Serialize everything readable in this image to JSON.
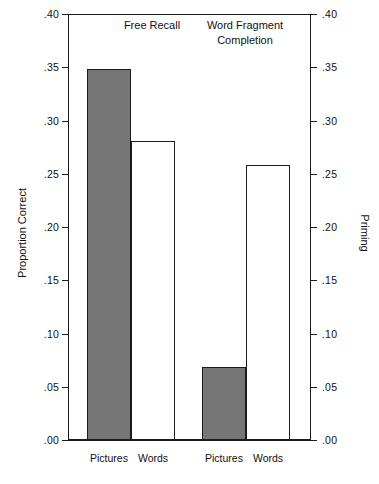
{
  "chart_data": {
    "type": "bar",
    "title": "",
    "subtitle": "",
    "xlabel": "",
    "ylabel": "Proportion Correct",
    "ylabel_right": "Priming",
    "ylim": [
      0.0,
      0.4
    ],
    "ylim_right": [
      0.0,
      0.4
    ],
    "grid": false,
    "legend": "none",
    "ytick_labels": [
      ".40",
      ".35",
      ".30",
      ".25",
      ".20",
      ".15",
      ".10",
      ".05",
      ".00"
    ],
    "ytick_values": [
      0.4,
      0.35,
      0.3,
      0.25,
      0.2,
      0.15,
      0.1,
      0.05,
      0.0
    ],
    "ytick_labels_right": [
      ".40",
      ".35",
      ".30",
      ".25",
      ".20",
      ".15",
      ".10",
      ".05",
      ".00"
    ],
    "groups": [
      {
        "name": "Free Recall",
        "axis": "left",
        "categories": [
          "Pictures",
          "Words"
        ],
        "values": [
          0.348,
          0.281
        ],
        "styles": [
          "filled",
          "open"
        ]
      },
      {
        "name": "Word Fragment\nCompletion",
        "axis": "right",
        "categories": [
          "Pictures",
          "Words"
        ],
        "values": [
          0.069,
          0.258
        ],
        "styles": [
          "filled",
          "open"
        ]
      }
    ],
    "categories": [
      "Pictures",
      "Words",
      "Pictures",
      "Words"
    ],
    "values": [
      0.348,
      0.281,
      0.069,
      0.258
    ],
    "series": [
      {
        "name": "Proportion Correct / Priming",
        "values": [
          0.348,
          0.281,
          0.069,
          0.258
        ]
      }
    ],
    "colors": {
      "filled_bar": "#767676",
      "open_bar": "#ffffff",
      "outline": "#1b1b1b",
      "background": "#ffffff",
      "text": "#111111"
    }
  },
  "bars": [
    {
      "label": "Pictures",
      "group": "Free Recall",
      "value": 0.348,
      "style": "filled"
    },
    {
      "label": "Words",
      "group": "Free Recall",
      "value": 0.281,
      "style": "open"
    },
    {
      "label": "Pictures",
      "group": "Word Fragment Completion",
      "value": 0.069,
      "style": "filled"
    },
    {
      "label": "Words",
      "group": "Word Fragment Completion",
      "value": 0.258,
      "style": "open"
    }
  ]
}
